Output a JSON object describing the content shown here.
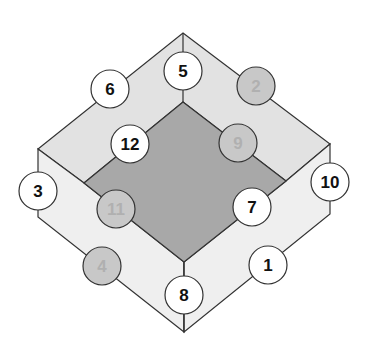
{
  "diagram": {
    "type": "isometric-frame-with-numbered-nodes",
    "colors": {
      "background": "#ffffff",
      "top_face": "#e2e2e2",
      "side_face": "#efefef",
      "inner_diamond": "#a8a8a8",
      "edge": "#333333",
      "node_white_fill": "#ffffff",
      "node_white_text": "#111111",
      "node_gray_fill": "#c8c8c8",
      "node_gray_text": "#b0b0b0",
      "node_stroke": "#333333"
    },
    "nodes": [
      {
        "label": "1",
        "x": 268,
        "y": 265,
        "style": "white"
      },
      {
        "label": "2",
        "x": 256,
        "y": 86,
        "style": "gray"
      },
      {
        "label": "3",
        "x": 38,
        "y": 191,
        "style": "white"
      },
      {
        "label": "4",
        "x": 102,
        "y": 266,
        "style": "gray"
      },
      {
        "label": "5",
        "x": 183,
        "y": 71,
        "style": "white"
      },
      {
        "label": "6",
        "x": 110,
        "y": 89,
        "style": "white"
      },
      {
        "label": "7",
        "x": 252,
        "y": 207,
        "style": "white"
      },
      {
        "label": "8",
        "x": 184,
        "y": 295,
        "style": "white"
      },
      {
        "label": "9",
        "x": 238,
        "y": 143,
        "style": "gray"
      },
      {
        "label": "10",
        "x": 330,
        "y": 182,
        "style": "white"
      },
      {
        "label": "11",
        "x": 116,
        "y": 209,
        "style": "gray"
      },
      {
        "label": "12",
        "x": 130,
        "y": 144,
        "style": "white"
      }
    ],
    "node_radius": 19
  }
}
